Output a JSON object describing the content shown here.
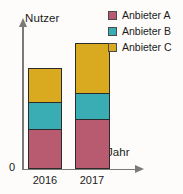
{
  "chart_data": {
    "type": "bar",
    "title": "",
    "subtitle": "",
    "stacked": true,
    "xlabel": "Jahr",
    "ylabel": "Nutzer",
    "origin_label": "0",
    "grid": false,
    "legend_position": "top-right",
    "axis_ticks_y": [],
    "ylim": [
      0,
      160
    ],
    "categories": [
      "2016",
      "2017"
    ],
    "series": [
      {
        "name": "Anbieter A",
        "color": "#b85a70",
        "values": [
          45,
          56
        ]
      },
      {
        "name": "Anbieter B",
        "color": "#3aacb4",
        "values": [
          31,
          30
        ]
      },
      {
        "name": "Anbieter C",
        "color": "#d9a91f",
        "values": [
          38,
          56
        ]
      }
    ],
    "totals": [
      114,
      142
    ],
    "annotations": []
  },
  "axes": {
    "y_caption": "Nutzer",
    "x_caption": "Jahr",
    "origin": "0"
  },
  "categories": {
    "first": "2016",
    "second": "2017"
  },
  "legend": {
    "items": [
      {
        "label": "Anbieter A",
        "color": "#b85a70"
      },
      {
        "label": "Anbieter B",
        "color": "#3aacb4"
      },
      {
        "label": "Anbieter C",
        "color": "#d9a91f"
      }
    ]
  }
}
